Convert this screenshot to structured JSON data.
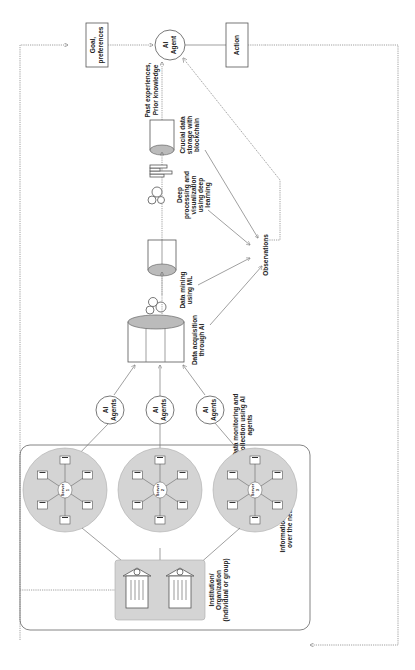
{
  "diagram": {
    "orientation": "rotated-90-ccw",
    "agent": {
      "label_line1": "AI",
      "label_line2": "Agent"
    },
    "goal": {
      "line1": "Goal,",
      "line2": "preferences"
    },
    "action": {
      "label": "Action"
    },
    "past": {
      "line1": "Past experiences,",
      "line2": "Prior knowledge"
    },
    "observations": {
      "label": "Observations"
    },
    "crucial": {
      "line1": "Crucial data",
      "line2": "storage with",
      "line3": "blockchain"
    },
    "deep": {
      "line1": "Deep",
      "line2": "processing and",
      "line3": "visualization",
      "line4": "using deep",
      "line5": "learning"
    },
    "mining": {
      "line1": "Data mining",
      "line2": "using ML"
    },
    "acquisition": {
      "line1": "Data acquisition",
      "line2": "through AI"
    },
    "monitoring": {
      "line1": "Data monitoring and",
      "line2": "collection using AI",
      "line3": "agents"
    },
    "agents": [
      {
        "line1": "AI",
        "line2": "Agents"
      },
      {
        "line1": "AI",
        "line2": "Agents"
      },
      {
        "line1": "AI",
        "line2": "Agents"
      }
    ],
    "servers": [
      {
        "line1": "Server",
        "line2": "1"
      },
      {
        "line1": "Server",
        "line2": "2"
      },
      {
        "line1": "Server",
        "line2": "3"
      }
    ],
    "network": {
      "line1": "Information sharing",
      "line2": "over the network"
    },
    "institution": {
      "line1": "Institution/",
      "line2": "Organization",
      "line3": "(individual or group)"
    }
  }
}
